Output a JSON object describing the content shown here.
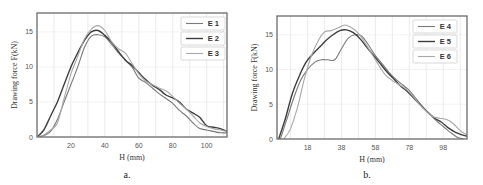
{
  "chart_data": [
    {
      "type": "line",
      "panel": "a.",
      "title": "",
      "xlabel": "H (mm)",
      "ylabel": "Drawing force F(kN)",
      "xlim": [
        0,
        112
      ],
      "ylim": [
        0,
        17.7
      ],
      "xticks": [
        20,
        40,
        60,
        80,
        100
      ],
      "yticks": [
        0,
        5,
        10,
        15
      ],
      "grid": true,
      "legend_position": "upper right",
      "series": [
        {
          "name": "E 1",
          "color": "#7a7a7a",
          "width": 1.1,
          "x": [
            0,
            4,
            8,
            12,
            16,
            20,
            24,
            28,
            32,
            36,
            40,
            44,
            48,
            52,
            56,
            60,
            64,
            68,
            72,
            76,
            80,
            84,
            88,
            92,
            96,
            100,
            104,
            108,
            112
          ],
          "y": [
            0,
            0.2,
            0.8,
            2.5,
            5.0,
            7.5,
            10.0,
            12.8,
            14.4,
            14.6,
            14.3,
            13.2,
            12.0,
            11.0,
            10.0,
            8.4,
            7.8,
            7.0,
            6.2,
            5.5,
            4.8,
            3.8,
            3.0,
            2.0,
            1.2,
            1.0,
            0.8,
            0.6,
            0.6
          ]
        },
        {
          "name": "E 2",
          "color": "#3e3e3e",
          "width": 1.4,
          "x": [
            0,
            4,
            8,
            12,
            16,
            20,
            24,
            28,
            32,
            36,
            40,
            44,
            48,
            52,
            56,
            60,
            64,
            68,
            72,
            76,
            80,
            84,
            88,
            92,
            96,
            100,
            104,
            108,
            112
          ],
          "y": [
            0,
            1.0,
            3.0,
            5.0,
            7.5,
            10.0,
            12.0,
            13.8,
            15.0,
            15.2,
            14.5,
            13.5,
            12.2,
            11.0,
            10.2,
            9.2,
            8.2,
            7.4,
            6.8,
            6.0,
            5.6,
            5.0,
            4.0,
            3.4,
            2.8,
            1.6,
            1.4,
            1.2,
            0.8
          ]
        },
        {
          "name": "E 3",
          "color": "#a8a8a8",
          "width": 1.1,
          "x": [
            0,
            4,
            8,
            12,
            16,
            20,
            24,
            28,
            32,
            36,
            40,
            44,
            48,
            52,
            56,
            60,
            64,
            68,
            72,
            76,
            80,
            84,
            88,
            92,
            96,
            100,
            104,
            108,
            112
          ],
          "y": [
            0,
            0.3,
            1.0,
            2.0,
            5.5,
            9.0,
            11.5,
            14.0,
            15.4,
            15.9,
            15.2,
            13.6,
            12.6,
            12.0,
            10.5,
            9.0,
            8.0,
            7.5,
            7.0,
            6.6,
            5.8,
            4.8,
            4.0,
            3.0,
            2.0,
            1.5,
            1.2,
            1.0,
            0.8
          ]
        }
      ]
    },
    {
      "type": "line",
      "panel": "b.",
      "title": "",
      "xlabel": "H (mm)",
      "ylabel": "Drawing force F(kN)",
      "xlim": [
        0,
        112
      ],
      "ylim": [
        0,
        17.7
      ],
      "xticks": [
        18,
        38,
        58,
        78,
        98
      ],
      "yticks": [
        0,
        5,
        10,
        15
      ],
      "grid": true,
      "legend_position": "upper right",
      "series": [
        {
          "name": "E 4",
          "color": "#7a7a7a",
          "width": 1.1,
          "x": [
            2,
            6,
            10,
            14,
            18,
            22,
            26,
            30,
            34,
            38,
            42,
            46,
            50,
            54,
            58,
            62,
            66,
            70,
            74,
            78,
            82,
            86,
            90,
            94,
            98,
            102,
            106,
            110
          ],
          "y": [
            0,
            3.0,
            6.0,
            8.5,
            10.0,
            11.0,
            11.4,
            11.4,
            11.4,
            13.0,
            14.5,
            15.0,
            14.8,
            13.5,
            12.0,
            10.8,
            9.6,
            8.6,
            7.8,
            7.0,
            5.8,
            4.6,
            3.6,
            2.6,
            1.8,
            1.0,
            0.3,
            0
          ]
        },
        {
          "name": "E 5",
          "color": "#3e3e3e",
          "width": 1.4,
          "x": [
            1,
            5,
            9,
            13,
            17,
            21,
            25,
            29,
            33,
            37,
            41,
            45,
            49,
            53,
            57,
            61,
            65,
            69,
            73,
            77,
            81,
            85,
            89,
            93,
            97,
            101,
            105,
            109,
            112
          ],
          "y": [
            0,
            3.0,
            6.5,
            9.0,
            11.0,
            12.2,
            13.2,
            14.2,
            15.0,
            15.6,
            15.7,
            15.3,
            14.4,
            13.2,
            12.0,
            10.8,
            9.6,
            8.6,
            7.6,
            6.8,
            5.8,
            4.8,
            3.8,
            3.0,
            2.4,
            1.6,
            1.0,
            0.6,
            0.4
          ]
        },
        {
          "name": "E 6",
          "color": "#a8a8a8",
          "width": 1.1,
          "x": [
            4,
            8,
            12,
            16,
            20,
            24,
            28,
            32,
            36,
            40,
            44,
            48,
            52,
            56,
            60,
            64,
            68,
            72,
            76,
            80,
            84,
            88,
            92,
            96,
            100,
            104,
            108,
            112
          ],
          "y": [
            0,
            1.5,
            4.5,
            8.5,
            11.8,
            14.0,
            15.4,
            15.6,
            16.0,
            16.4,
            16.0,
            15.2,
            13.8,
            12.2,
            10.6,
            9.2,
            8.4,
            7.8,
            7.2,
            6.2,
            5.0,
            4.0,
            3.2,
            3.0,
            2.8,
            2.2,
            1.2,
            0.6
          ]
        }
      ]
    }
  ],
  "panels": [
    {
      "caption": "a.",
      "xlabel": "H (mm)",
      "ylabel": "Drawing force F(kN)",
      "xtick_labels": [
        "20",
        "40",
        "60",
        "80",
        "100"
      ],
      "ytick_labels": [
        "0",
        "5",
        "10",
        "15"
      ],
      "legend": [
        "E 1",
        "E 2",
        "E 3"
      ]
    },
    {
      "caption": "b.",
      "xlabel": "H (mm)",
      "ylabel": "Drawing force F(kN)",
      "xtick_labels": [
        "18",
        "38",
        "58",
        "78",
        "98"
      ],
      "ytick_labels": [
        "0",
        "5",
        "10",
        "15"
      ],
      "legend": [
        "E 4",
        "E 5",
        "E 6"
      ]
    }
  ]
}
